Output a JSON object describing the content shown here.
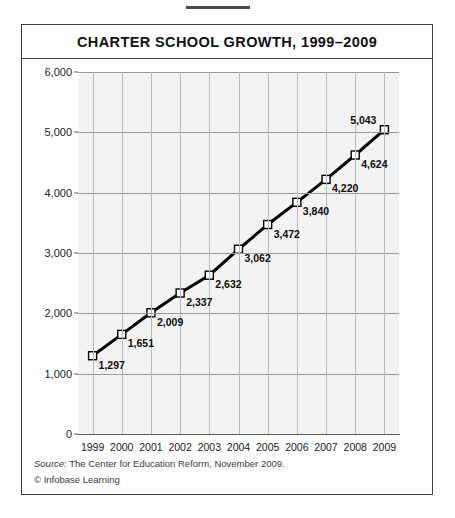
{
  "figure": {
    "title": "CHARTER SCHOOL GROWTH, 1999–2009",
    "source_label": "Source:",
    "source_text": " The Center for Education Reform, November 2009.",
    "copyright": "© Infobase Learning"
  },
  "chart_data": {
    "type": "line",
    "title": "CHARTER SCHOOL GROWTH, 1999–2009",
    "xlabel": "",
    "ylabel": "",
    "categories": [
      "1999",
      "2000",
      "2001",
      "2002",
      "2003",
      "2004",
      "2005",
      "2006",
      "2007",
      "2008",
      "2009"
    ],
    "values": [
      1297,
      1651,
      2009,
      2337,
      2632,
      3062,
      3472,
      3840,
      4220,
      4624,
      5043
    ],
    "point_labels": [
      "1,297",
      "1,651",
      "2,009",
      "2,337",
      "2,632",
      "3,062",
      "3,472",
      "3,840",
      "4,220",
      "4,624",
      "5,043"
    ],
    "ylim": [
      0,
      6000
    ],
    "yticks": [
      0,
      1000,
      2000,
      3000,
      4000,
      5000,
      6000
    ],
    "ytick_labels": [
      "0",
      "1,000",
      "2,000",
      "3,000",
      "4,000",
      "5,000",
      "6,000"
    ],
    "grid": true,
    "legend": "none",
    "line_color": "#000000",
    "marker": "white-square",
    "marker_fill": "#ffffff",
    "marker_edge": "#000000",
    "plot_background": "#f3f3f3"
  }
}
